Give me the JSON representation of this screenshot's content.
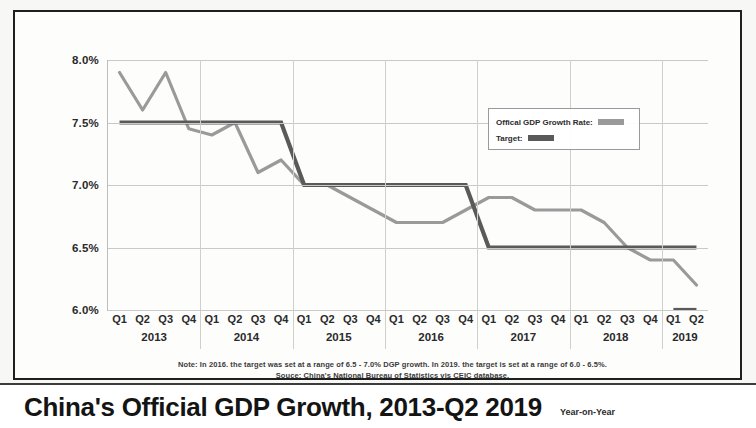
{
  "title": "China's Official GDP Growth, 2013-Q2 2019",
  "subtitle": "Year-on-Year",
  "notes": {
    "line1": "Note: In 2016. the target was set at a range of 6.5 - 7.0% DGP growth. In 2019. the target is set at a range of 6.0 - 6.5%.",
    "line2": "Souce: China's National Bureau of Statistics vis CEIC database."
  },
  "legend": {
    "official_label": "Offical GDP Growth Rate:",
    "target_label": "Target:",
    "official_color": "#9a9a9a",
    "target_color": "#5a5a5a"
  },
  "chart_data": {
    "type": "line",
    "title": "China's Official GDP Growth, 2013-Q2 2019",
    "subtitle": "Year-on-Year",
    "xlabel": "",
    "ylabel": "",
    "ylim": [
      6.0,
      8.0
    ],
    "ytick_labels": [
      "8.0%",
      "7.5%",
      "7.0%",
      "6.5%",
      "6.0%"
    ],
    "ytick_values": [
      8.0,
      7.5,
      7.0,
      6.5,
      6.0
    ],
    "grid": true,
    "legend_position": "upper-right",
    "years": [
      "2013",
      "2014",
      "2015",
      "2016",
      "2017",
      "2018",
      "2019"
    ],
    "quarters": [
      "Q1",
      "Q2",
      "Q3",
      "Q4"
    ],
    "x": [
      "Q1 2013",
      "Q2 2013",
      "Q3 2013",
      "Q4 2013",
      "Q1 2014",
      "Q2 2014",
      "Q3 2014",
      "Q4 2014",
      "Q1 2015",
      "Q2 2015",
      "Q3 2015",
      "Q4 2015",
      "Q1 2016",
      "Q2 2016",
      "Q3 2016",
      "Q4 2016",
      "Q1 2017",
      "Q2 2017",
      "Q3 2017",
      "Q4 2017",
      "Q1 2018",
      "Q2 2018",
      "Q3 2018",
      "Q4 2018",
      "Q1 2019",
      "Q2 2019"
    ],
    "series": [
      {
        "name": "Offical GDP Growth Rate:",
        "color": "#9a9a9a",
        "values": [
          7.9,
          7.6,
          7.9,
          7.45,
          7.4,
          7.5,
          7.1,
          7.2,
          7.0,
          7.0,
          6.9,
          6.8,
          6.7,
          6.7,
          6.7,
          6.8,
          6.9,
          6.9,
          6.8,
          6.8,
          6.8,
          6.7,
          6.5,
          6.4,
          6.4,
          6.2
        ]
      }
    ],
    "target_segments": [
      {
        "label": "7.5% target",
        "value": 7.5,
        "from": "Q1 2013",
        "to": "Q4 2014",
        "color": "#5a5a5a"
      },
      {
        "label": "7.0% target",
        "value": 7.0,
        "from": "Q1 2015",
        "to": "Q4 2016",
        "color": "#5a5a5a"
      },
      {
        "label": "6.5% target",
        "value": 6.5,
        "from": "Q1 2017",
        "to": "Q2 2019",
        "color": "#5a5a5a"
      },
      {
        "label": "6.0% target",
        "value": 6.0,
        "from": "Q1 2019",
        "to": "Q2 2019",
        "color": "#5a5a5a"
      }
    ]
  }
}
